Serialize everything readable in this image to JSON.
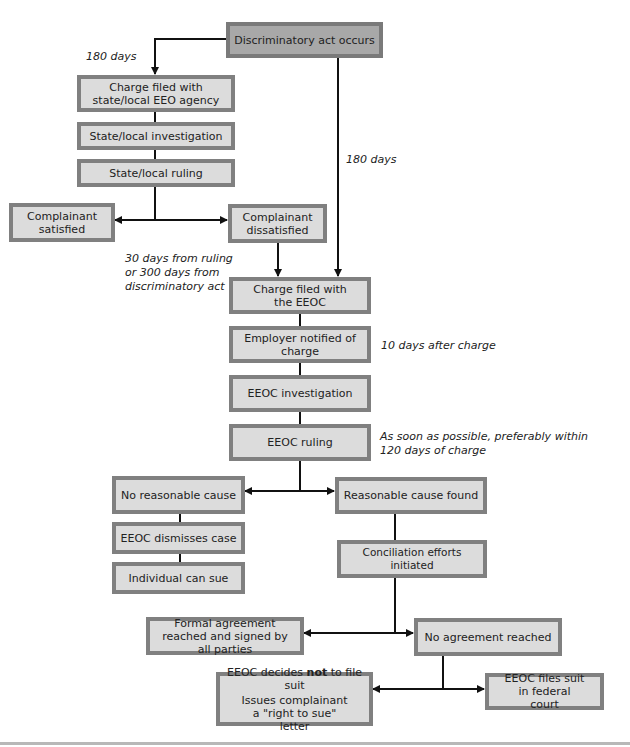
{
  "diagram": {
    "nodes": {
      "discriminatory_act": "Discriminatory act occurs",
      "charge_state": "Charge filed with state/local EEO agency",
      "state_investigation": "State/local investigation",
      "state_ruling": "State/local ruling",
      "complainant_satisfied": "Complainant satisfied",
      "complainant_dissatisfied": "Complainant dissatisfied",
      "charge_eeoc": "Charge filed with the EEOC",
      "employer_notified": "Employer notified of charge",
      "eeoc_investigation": "EEOC investigation",
      "eeoc_ruling": "EEOC ruling",
      "no_reasonable_cause": "No reasonable cause",
      "eeoc_dismisses": "EEOC dismisses case",
      "individual_can_sue": "Individual can sue",
      "reasonable_cause": "Reasonable cause found",
      "conciliation": "Conciliation efforts initiated",
      "formal_agreement": "Formal agreement reached and signed by all parties",
      "no_agreement": "No agreement reached",
      "eeoc_not_file_pre": "EEOC decides ",
      "eeoc_not_file_bold": "not",
      "eeoc_not_file_post": " to file suit",
      "eeoc_not_file_line2": "Issues complainant a \"right to sue\" letter",
      "eeoc_files_suit": "EEOC files suit in federal court"
    },
    "notes": {
      "days_180_left": "180 days",
      "days_180_right": "180 days",
      "days_30_line1": "30 days from ruling",
      "days_30_line2": "or 300 days from",
      "days_30_line3": "discriminatory act",
      "ten_days": "10 days after charge",
      "ruling_line1": "As soon as possible, preferably within",
      "ruling_line2": "120 days of charge"
    },
    "colors": {
      "box_fill": "#dcdcdc",
      "box_fill_start": "#a8a8a8",
      "box_border": "#808080",
      "line": "#111111"
    }
  }
}
